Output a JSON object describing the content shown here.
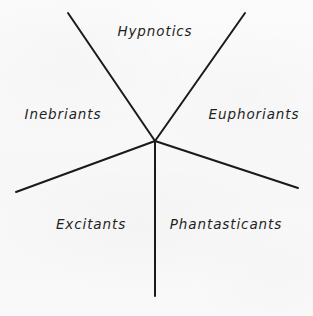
{
  "figure": {
    "type": "radial-classification-diagram",
    "background_color": "#f8f8f8",
    "line_color": "#1a1a1a",
    "text_color": "#1f1f1f",
    "width": 313,
    "height": 316,
    "center": {
      "x": 155,
      "y": 141
    },
    "spoke_count": 5
  },
  "spokes": [
    {
      "name": "upper-left-spoke",
      "x1": 155,
      "y1": 141,
      "x2": 68,
      "y2": 13
    },
    {
      "name": "upper-right-spoke",
      "x1": 155,
      "y1": 141,
      "x2": 245,
      "y2": 13
    },
    {
      "name": "left-spoke",
      "x1": 155,
      "y1": 141,
      "x2": 16,
      "y2": 192
    },
    {
      "name": "right-spoke",
      "x1": 155,
      "y1": 141,
      "x2": 298,
      "y2": 188
    },
    {
      "name": "bottom-spoke",
      "x1": 155,
      "y1": 141,
      "x2": 155,
      "y2": 296
    }
  ],
  "sectors": [
    {
      "id": "hypnotics",
      "label": "Hypnotics",
      "position": "top"
    },
    {
      "id": "inebriants",
      "label": "Inebriants",
      "position": "left"
    },
    {
      "id": "euphoriants",
      "label": "Euphoriants",
      "position": "right"
    },
    {
      "id": "excitants",
      "label": "Excitants",
      "position": "bottom-left"
    },
    {
      "id": "phantasticants",
      "label": "Phantasticants",
      "position": "bottom-right"
    }
  ],
  "bottom_caption": {
    "visible_fragment": "",
    "note": "truncated illegible text row at image bottom edge"
  }
}
